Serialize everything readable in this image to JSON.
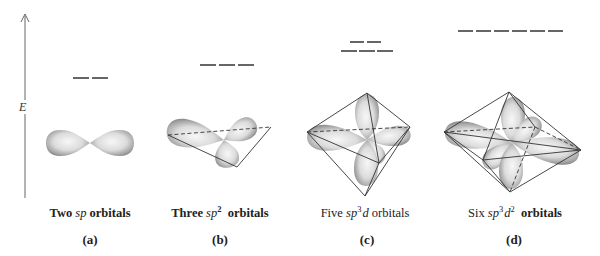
{
  "figure": {
    "axis": {
      "label": "E",
      "description": "Energy axis, increasing upward"
    },
    "panels": [
      {
        "id": "a",
        "label": "(a)",
        "caption_prefix": "Two ",
        "caption_italic": "sp",
        "caption_sup": "",
        "caption_italic2": "",
        "caption_sup2": "",
        "caption_suffix": " orbitals",
        "hybridization": "sp",
        "orbital_count": 2,
        "energy_level_rows": [
          2
        ],
        "geometry": "linear"
      },
      {
        "id": "b",
        "label": "(b)",
        "caption_prefix": "Three ",
        "caption_italic": "sp",
        "caption_sup": "2",
        "caption_italic2": "",
        "caption_sup2": "",
        "caption_suffix": "  orbitals",
        "hybridization": "sp2",
        "orbital_count": 3,
        "energy_level_rows": [
          3
        ],
        "geometry": "trigonal planar"
      },
      {
        "id": "c",
        "label": "(c)",
        "caption_prefix": "Five ",
        "caption_italic": "sp",
        "caption_sup": "3",
        "caption_italic2": "d",
        "caption_sup2": "",
        "caption_suffix": " orbitals",
        "hybridization": "sp3d",
        "orbital_count": 5,
        "energy_level_rows": [
          2,
          3
        ],
        "geometry": "trigonal bipyramidal"
      },
      {
        "id": "d",
        "label": "(d)",
        "caption_prefix": "Six ",
        "caption_italic": "sp",
        "caption_sup": "3",
        "caption_italic2": "d",
        "caption_sup2": "2",
        "caption_suffix": "  orbitals",
        "hybridization": "sp3d2",
        "orbital_count": 6,
        "energy_level_rows": [
          6
        ],
        "geometry": "octahedral"
      }
    ],
    "colors": {
      "line": "#333333",
      "energy_level": "#555555",
      "orbital_fill_light": "#f2f2f2",
      "orbital_fill_dark": "#9a9a9a"
    }
  }
}
